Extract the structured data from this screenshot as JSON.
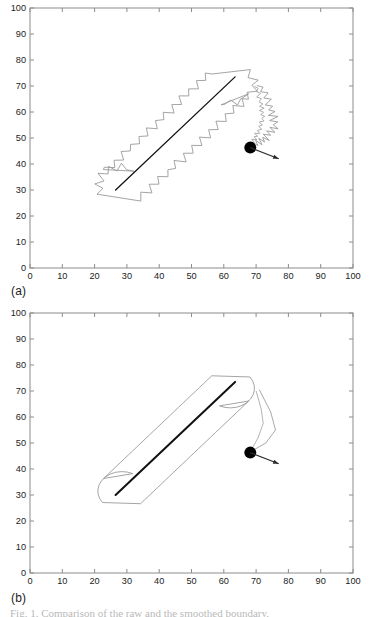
{
  "figure": {
    "panels": [
      {
        "id": "a",
        "label": "(a)",
        "contour_style": "jagged",
        "description": "Noisy zigzag contour around capsule-shaped swept region with centerline and moving agent"
      },
      {
        "id": "b",
        "label": "(b)",
        "contour_style": "smooth",
        "description": "Smoothed contour around capsule-shaped swept region with centerline and moving agent"
      }
    ],
    "caption_partial": "Fig. 1. Comparison of the raw and the smoothed boundary."
  },
  "chart_data": {
    "type": "scatter",
    "title": "",
    "xlabel": "",
    "ylabel": "",
    "xlim": [
      0,
      100
    ],
    "ylim": [
      0,
      100
    ],
    "xticks": [
      0,
      10,
      20,
      30,
      40,
      50,
      60,
      70,
      80,
      90,
      100
    ],
    "yticks": [
      0,
      10,
      20,
      30,
      40,
      50,
      60,
      70,
      80,
      90,
      100
    ],
    "grid": false,
    "legend": null,
    "colors": {
      "contour": "#9a9a9a",
      "centerline": "#111111",
      "agent": "#000000",
      "arrow": "#2b2b2b",
      "axis": "#8c8c8c",
      "background": "#ffffff"
    },
    "panels": [
      {
        "id": "a",
        "label": "(a)",
        "contour_type": "jagged",
        "centerline": {
          "x": [
            26.5,
            63.5
          ],
          "y": [
            30.0,
            73.5
          ]
        },
        "agent": {
          "x": 68.2,
          "y": 46.3,
          "radius_px": 6
        },
        "agent_arrow": {
          "x0": 68.2,
          "y0": 46.3,
          "x1": 77.0,
          "y1": 42.0
        },
        "capsule": {
          "axis_start": {
            "x": 28.5,
            "y": 31.5
          },
          "axis_end": {
            "x": 62.0,
            "y": 71.0
          },
          "radius": 7.5,
          "tail": [
            {
              "x": 71.0,
              "y": 70.5
            },
            {
              "x": 74.5,
              "y": 62.0
            },
            {
              "x": 76.0,
              "y": 55.0
            },
            {
              "x": 73.0,
              "y": 50.0
            },
            {
              "x": 69.5,
              "y": 47.5
            }
          ]
        }
      },
      {
        "id": "b",
        "label": "(b)",
        "contour_type": "smooth",
        "centerline": {
          "x": [
            26.5,
            63.5
          ],
          "y": [
            30.0,
            73.5
          ]
        },
        "agent": {
          "x": 68.2,
          "y": 46.3,
          "radius_px": 6
        },
        "agent_arrow": {
          "x0": 68.2,
          "y0": 46.3,
          "x1": 77.0,
          "y1": 42.0
        },
        "capsule": {
          "axis_start": {
            "x": 28.5,
            "y": 31.5
          },
          "axis_end": {
            "x": 62.0,
            "y": 71.0
          },
          "radius": 7.5,
          "tail": [
            {
              "x": 71.0,
              "y": 70.5
            },
            {
              "x": 74.5,
              "y": 62.0
            },
            {
              "x": 76.0,
              "y": 55.0
            },
            {
              "x": 73.0,
              "y": 50.0
            },
            {
              "x": 69.5,
              "y": 47.5
            }
          ]
        }
      }
    ]
  }
}
